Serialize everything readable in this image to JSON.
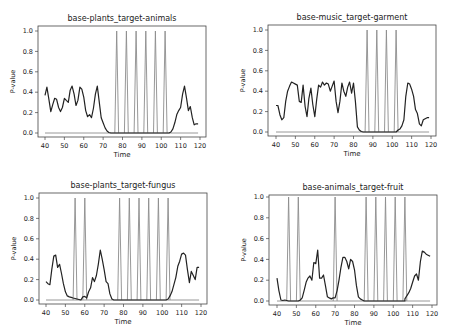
{
  "figure": {
    "layout": "2x2 grid of line charts",
    "colors": {
      "pvalue_line": "#222222",
      "spike_line": "#8c8c8c",
      "zero_line": "#8c8c8c",
      "frame": "#444444"
    }
  },
  "chart_data": [
    {
      "type": "line",
      "title": "base-plants_target-animals",
      "xlabel": "Time",
      "ylabel": "P-value",
      "xlim": [
        38,
        122
      ],
      "ylim": [
        -0.05,
        1.05
      ],
      "xticks": [
        40,
        50,
        60,
        70,
        80,
        90,
        100,
        110,
        120
      ],
      "yticks": [
        "0.0",
        "0.2",
        "0.4",
        "0.6",
        "0.8",
        "1.0"
      ],
      "grid": false,
      "series": [
        {
          "name": "p-value",
          "x": [
            40,
            41,
            42,
            43,
            44,
            45,
            46,
            47,
            48,
            49,
            50,
            51,
            52,
            53,
            54,
            55,
            56,
            57,
            58,
            59,
            60,
            61,
            62,
            63,
            64,
            65,
            66,
            67,
            68,
            69,
            70,
            71,
            72,
            73,
            74,
            75,
            76,
            104,
            105,
            106,
            107,
            108,
            109,
            110,
            111,
            112,
            113,
            114,
            115,
            116,
            117,
            118,
            119
          ],
          "y": [
            0.37,
            0.45,
            0.33,
            0.21,
            0.28,
            0.34,
            0.33,
            0.25,
            0.21,
            0.25,
            0.34,
            0.32,
            0.3,
            0.42,
            0.46,
            0.38,
            0.27,
            0.32,
            0.45,
            0.43,
            0.35,
            0.22,
            0.16,
            0.18,
            0.15,
            0.24,
            0.38,
            0.46,
            0.3,
            0.15,
            0.1,
            0.05,
            0.02,
            0.005,
            0.0,
            0.0,
            0.0,
            0.0,
            0.01,
            0.04,
            0.1,
            0.18,
            0.22,
            0.25,
            0.38,
            0.46,
            0.35,
            0.22,
            0.26,
            0.15,
            0.08,
            0.09,
            0.09
          ]
        },
        {
          "name": "spikes",
          "peaks_at": [
            77,
            82,
            87,
            92,
            97,
            102
          ],
          "height": 1.0,
          "half_width": 1
        },
        {
          "name": "zero-line",
          "x": [
            40,
            119
          ],
          "y": [
            0,
            0
          ]
        }
      ]
    },
    {
      "type": "line",
      "title": "base-music_target-garment",
      "xlabel": "Time",
      "ylabel": "P-value",
      "xlim": [
        38,
        122
      ],
      "ylim": [
        -0.05,
        1.05
      ],
      "xticks": [
        40,
        50,
        60,
        70,
        80,
        90,
        100,
        110,
        120
      ],
      "yticks": [
        "0.0",
        "0.2",
        "0.4",
        "0.6",
        "0.8",
        "1.0"
      ],
      "grid": false,
      "series": [
        {
          "name": "p-value",
          "x": [
            40,
            41,
            42,
            43,
            44,
            45,
            46,
            47,
            48,
            49,
            50,
            51,
            52,
            53,
            54,
            55,
            56,
            57,
            58,
            59,
            60,
            61,
            62,
            63,
            64,
            65,
            66,
            67,
            68,
            69,
            70,
            71,
            72,
            73,
            74,
            75,
            76,
            77,
            78,
            79,
            80,
            81,
            82,
            83,
            84,
            85,
            86,
            102,
            103,
            104,
            105,
            106,
            107,
            108,
            109,
            110,
            111,
            112,
            113,
            114,
            115,
            116,
            117,
            118,
            119
          ],
          "y": [
            0.26,
            0.26,
            0.17,
            0.12,
            0.14,
            0.3,
            0.4,
            0.45,
            0.49,
            0.48,
            0.47,
            0.46,
            0.3,
            0.29,
            0.46,
            0.25,
            0.15,
            0.33,
            0.43,
            0.27,
            0.15,
            0.32,
            0.46,
            0.44,
            0.49,
            0.46,
            0.48,
            0.47,
            0.4,
            0.45,
            0.5,
            0.3,
            0.19,
            0.3,
            0.48,
            0.4,
            0.35,
            0.44,
            0.49,
            0.38,
            0.48,
            0.3,
            0.05,
            0.02,
            0.005,
            0.0,
            0.0,
            0.0,
            0.02,
            0.03,
            0.06,
            0.12,
            0.35,
            0.48,
            0.47,
            0.42,
            0.35,
            0.22,
            0.18,
            0.08,
            0.06,
            0.12,
            0.13,
            0.14,
            0.14
          ]
        },
        {
          "name": "spikes",
          "peaks_at": [
            87,
            92,
            97,
            102
          ],
          "height": 1.0,
          "half_width": 1
        },
        {
          "name": "zero-line",
          "x": [
            40,
            119
          ],
          "y": [
            0,
            0
          ]
        }
      ]
    },
    {
      "type": "line",
      "title": "base-plants_target-fungus",
      "xlabel": "Time",
      "ylabel": "P-value",
      "xlim": [
        38,
        122
      ],
      "ylim": [
        -0.05,
        1.05
      ],
      "xticks": [
        40,
        50,
        60,
        70,
        80,
        90,
        100,
        110,
        120
      ],
      "yticks": [
        "0.0",
        "0.2",
        "0.4",
        "0.6",
        "0.8",
        "1.0"
      ],
      "grid": false,
      "series": [
        {
          "name": "p-value",
          "x": [
            40,
            41,
            42,
            43,
            44,
            45,
            46,
            47,
            48,
            49,
            50,
            51,
            52,
            53,
            54,
            55,
            56,
            57,
            58,
            59,
            60,
            61,
            62,
            63,
            64,
            65,
            66,
            67,
            68,
            69,
            70,
            71,
            72,
            73,
            74,
            75,
            76,
            77,
            102,
            103,
            104,
            105,
            106,
            107,
            108,
            109,
            110,
            111,
            112,
            113,
            114,
            115,
            116,
            117,
            118,
            119
          ],
          "y": [
            0.18,
            0.16,
            0.15,
            0.3,
            0.43,
            0.44,
            0.32,
            0.35,
            0.26,
            0.16,
            0.08,
            0.04,
            0.03,
            0.025,
            0.02,
            0.015,
            0.01,
            0.005,
            0.0,
            0.03,
            0.035,
            0.02,
            0.08,
            0.12,
            0.22,
            0.18,
            0.24,
            0.35,
            0.49,
            0.4,
            0.3,
            0.18,
            0.16,
            0.06,
            0.01,
            0.0,
            0.0,
            0.0,
            0.0,
            0.01,
            0.04,
            0.08,
            0.15,
            0.22,
            0.33,
            0.38,
            0.45,
            0.46,
            0.44,
            0.3,
            0.17,
            0.28,
            0.24,
            0.2,
            0.32,
            0.32
          ]
        },
        {
          "name": "spikes",
          "peaks_at": [
            55,
            60,
            78,
            83,
            88,
            93,
            98,
            103
          ],
          "height": 1.0,
          "half_width": 1
        },
        {
          "name": "zero-line",
          "x": [
            40,
            119
          ],
          "y": [
            0,
            0
          ]
        }
      ]
    },
    {
      "type": "line",
      "title": "base-animals_target-fruit",
      "xlabel": "Time",
      "ylabel": "P-value",
      "xlim": [
        38,
        122
      ],
      "ylim": [
        -0.05,
        1.05
      ],
      "xticks": [
        40,
        50,
        60,
        70,
        80,
        90,
        100,
        110,
        120
      ],
      "yticks": [
        "0.0",
        "0.2",
        "0.4",
        "0.6",
        "0.8",
        "1.0"
      ],
      "grid": false,
      "series": [
        {
          "name": "p-value",
          "x": [
            40,
            41,
            42,
            43,
            44,
            45,
            46,
            47,
            48,
            49,
            50,
            51,
            52,
            53,
            54,
            55,
            56,
            57,
            58,
            59,
            60,
            61,
            62,
            63,
            64,
            65,
            66,
            67,
            68,
            69,
            70,
            71,
            72,
            73,
            74,
            75,
            76,
            77,
            78,
            79,
            80,
            81,
            82,
            83,
            84,
            85,
            106,
            107,
            108,
            109,
            110,
            111,
            112,
            113,
            114,
            115,
            116,
            117,
            118,
            119
          ],
          "y": [
            0.22,
            0.1,
            0.01,
            0.005,
            0.01,
            0.005,
            0.0,
            0.0,
            0.0,
            0.0,
            0.0,
            0.0,
            0.01,
            0.03,
            0.1,
            0.18,
            0.22,
            0.24,
            0.2,
            0.37,
            0.36,
            0.49,
            0.22,
            0.22,
            0.25,
            0.15,
            0.04,
            0.03,
            0.02,
            0.03,
            0.03,
            0.1,
            0.2,
            0.32,
            0.42,
            0.42,
            0.38,
            0.31,
            0.4,
            0.38,
            0.3,
            0.15,
            0.04,
            0.02,
            0.01,
            0.0,
            0.02,
            0.05,
            0.08,
            0.12,
            0.18,
            0.24,
            0.26,
            0.2,
            0.38,
            0.48,
            0.47,
            0.45,
            0.44,
            0.43
          ]
        },
        {
          "name": "spikes",
          "peaks_at": [
            46,
            51,
            70,
            86,
            91,
            96,
            101,
            106
          ],
          "height": 1.0,
          "half_width": 1
        },
        {
          "name": "zero-line",
          "x": [
            40,
            119
          ],
          "y": [
            0,
            0
          ]
        }
      ]
    }
  ],
  "panels_px": [
    {
      "frame": [
        38,
        26,
        206,
        137
      ],
      "x40": 45,
      "x120": 200,
      "y0": 133,
      "y1": 31
    },
    {
      "frame": [
        268,
        25,
        436,
        136
      ],
      "x40": 276,
      "x120": 431,
      "y0": 132,
      "y1": 30
    },
    {
      "frame": [
        39,
        193,
        207,
        304
      ],
      "x40": 46,
      "x120": 201,
      "y0": 300,
      "y1": 198
    },
    {
      "frame": [
        269,
        195,
        437,
        305
      ],
      "x40": 277,
      "x120": 432,
      "y0": 301,
      "y1": 197
    }
  ]
}
